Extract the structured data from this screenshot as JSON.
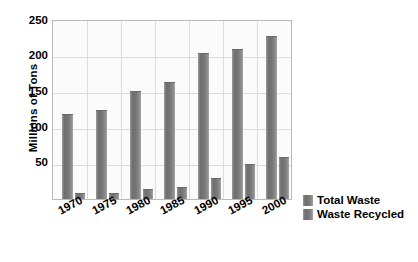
{
  "chart_data": {
    "type": "bar",
    "title": "",
    "xlabel": "",
    "ylabel": "Millions of Tons",
    "categories": [
      "1970",
      "1975",
      "1980",
      "1985",
      "1990",
      "1995",
      "2000"
    ],
    "series": [
      {
        "name": "Total Waste",
        "values": [
          118,
          124,
          150,
          162,
          203,
          209,
          227
        ]
      },
      {
        "name": "Waste Recycled",
        "values": [
          8,
          9,
          14,
          16,
          29,
          49,
          59
        ]
      }
    ],
    "ylim": [
      0,
      250
    ],
    "yticks": [
      250,
      200,
      150,
      100,
      50
    ],
    "grid": true,
    "legend_position": "right",
    "colors": {
      "bar": "#7a7a7a",
      "plot_background": "#fbfbfb",
      "gridline": "#dcdcdc",
      "axis_border": "#b9b9b9",
      "text": "#000000"
    }
  },
  "legend": {
    "items": [
      {
        "label": "Total Waste"
      },
      {
        "label": "Waste Recycled"
      }
    ]
  }
}
